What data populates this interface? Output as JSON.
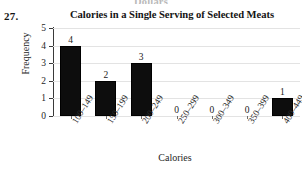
{
  "problem": {
    "number": "27."
  },
  "prev_figure": {
    "cut_caption": "Dollars"
  },
  "chart_data": {
    "type": "bar",
    "title": "Calories in a Single Serving of Selected Meats",
    "xlabel": "Calories",
    "ylabel": "Frequency",
    "categories": [
      "100–149",
      "150–199",
      "200–249",
      "250–299",
      "300–349",
      "350–399",
      "400–449"
    ],
    "values": [
      4,
      2,
      3,
      0,
      0,
      0,
      1
    ],
    "value_labels": [
      "4",
      "2",
      "3",
      "0",
      "0",
      "0",
      "1"
    ],
    "ylim": [
      0,
      5
    ],
    "yticks": [
      0,
      1,
      2,
      3,
      4,
      5
    ],
    "ytick_labels": [
      "0",
      "1",
      "2",
      "3",
      "4",
      "5"
    ],
    "grid": true,
    "legend": false,
    "bar_color": "#0d0d0d"
  }
}
